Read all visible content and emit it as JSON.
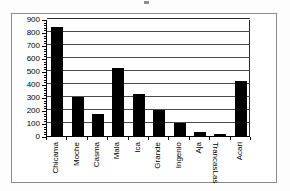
{
  "chart_data": {
    "type": "bar",
    "title": "",
    "subtitle": "",
    "xlabel": "",
    "ylabel": "",
    "ylim": [
      0,
      900
    ],
    "ytick_step": 100,
    "yticks": [
      "0",
      "100",
      "200",
      "300",
      "400",
      "500",
      "600",
      "700",
      "800",
      "900"
    ],
    "grid": true,
    "grid_axis": "y",
    "legend": "none",
    "bar_color": "#000000",
    "categories": [
      "Chicama",
      "Moche",
      "Casma",
      "Mala",
      "Ica",
      "Grande",
      "Ingenio",
      "Aja",
      "Las Trancas",
      "Acari"
    ],
    "category_lines": [
      [
        "Chicama"
      ],
      [
        "Moche"
      ],
      [
        "Casma"
      ],
      [
        "Mala"
      ],
      [
        "Ica"
      ],
      [
        "Grande"
      ],
      [
        "Ingenio"
      ],
      [
        "Aja"
      ],
      [
        "Las",
        "Trancas"
      ],
      [
        "Acari"
      ]
    ],
    "values": [
      840,
      300,
      172,
      520,
      320,
      200,
      100,
      30,
      12,
      425
    ]
  }
}
